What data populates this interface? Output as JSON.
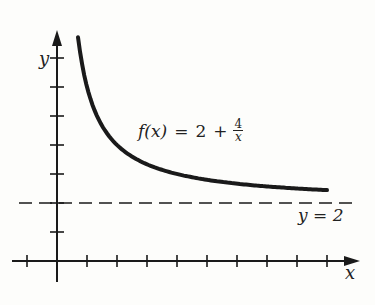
{
  "chart_data": {
    "type": "line",
    "title": "",
    "xlabel": "x",
    "ylabel": "y",
    "function_label": "f(x) = 2 + 4/x",
    "asymptote_label": "y = 2",
    "asymptote_y": 2,
    "x_ticks": [
      -1,
      1,
      2,
      3,
      4,
      5,
      6,
      7,
      8,
      9
    ],
    "y_ticks": [
      1,
      2,
      3,
      4,
      5,
      6,
      7
    ],
    "xlim": [
      -1.5,
      10
    ],
    "ylim": [
      -0.7,
      7.6
    ],
    "grid": false,
    "series": [
      {
        "name": "f(x) = 2 + 4/x",
        "x": [
          0.7,
          0.8,
          1,
          1.25,
          1.5,
          2,
          2.5,
          3,
          4,
          5,
          6,
          7,
          8,
          9
        ],
        "y": [
          7.71,
          7,
          6,
          5.2,
          4.67,
          4,
          3.6,
          3.33,
          3,
          2.8,
          2.67,
          2.57,
          2.5,
          2.44
        ]
      }
    ]
  },
  "labels": {
    "y_axis": "y",
    "x_axis": "x",
    "func_fx": "f(x)",
    "func_eq": "=",
    "func_two": "2",
    "func_plus": "+",
    "func_num": "4",
    "func_den": "x",
    "asymptote": "y = 2"
  }
}
